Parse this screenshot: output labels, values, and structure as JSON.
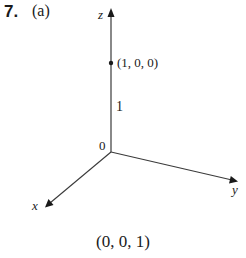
{
  "problem": {
    "number": "7.",
    "part": "(a)"
  },
  "diagram": {
    "axes": {
      "z_label": "z",
      "y_label": "y",
      "x_label": "x",
      "origin_label": "0"
    },
    "point": {
      "label": "(1, 0, 0)"
    },
    "tick": {
      "label": "1"
    },
    "colors": {
      "stroke": "#3a3a3a",
      "text": "#1a1a1a"
    }
  },
  "caption": "(0, 0, 1)"
}
